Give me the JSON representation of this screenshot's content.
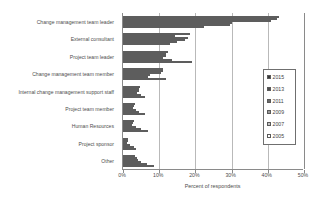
{
  "chart_data": {
    "type": "bar",
    "orientation": "horizontal",
    "title": "",
    "xlabel": "Percent of respondents",
    "ylabel": "",
    "xlim": [
      0,
      50
    ],
    "xticks": [
      "0%",
      "10%",
      "20%",
      "30%",
      "40%",
      "50%"
    ],
    "xtick_values": [
      0,
      10,
      20,
      30,
      40,
      50
    ],
    "grid": true,
    "legend_position": "right",
    "categories": [
      "Change management team leader",
      "External consultant",
      "Project team leader",
      "Change management team member",
      "Internal change management support staff",
      "Project team member",
      "Human Resources",
      "Project sponsor",
      "Other"
    ],
    "series": [
      {
        "name": "2015",
        "color": "#3a3a3a",
        "values": [
          43.0,
          18.5,
          12.5,
          11.0,
          4.8,
          3.2,
          3.0,
          1.5,
          3.2
        ]
      },
      {
        "name": "2013",
        "color": "#4f4f4f",
        "values": [
          42.5,
          14.5,
          12.0,
          11.0,
          4.5,
          3.0,
          2.8,
          1.4,
          3.8
        ]
      },
      {
        "name": "2011",
        "color": "#6b6b6b",
        "values": [
          41.0,
          18.0,
          12.0,
          10.5,
          4.5,
          2.8,
          2.5,
          1.2,
          4.2
        ]
      },
      {
        "name": "2009",
        "color": "#9a9a9a",
        "values": [
          30.0,
          17.0,
          11.0,
          7.5,
          4.0,
          3.5,
          3.5,
          2.0,
          5.0
        ]
      },
      {
        "name": "2007",
        "color": "#c4c4c4",
        "values": [
          29.5,
          15.0,
          13.5,
          7.0,
          5.0,
          4.5,
          5.0,
          3.0,
          6.5
        ]
      },
      {
        "name": "2005",
        "color": "#ffffff",
        "values": [
          22.5,
          13.0,
          19.0,
          12.0,
          6.0,
          6.0,
          7.0,
          3.5,
          8.5
        ]
      }
    ]
  },
  "legend": {
    "items": [
      {
        "label": "2015"
      },
      {
        "label": "2013"
      },
      {
        "label": "2011"
      },
      {
        "label": "2009"
      },
      {
        "label": "2007"
      },
      {
        "label": "2005"
      }
    ]
  },
  "axis": {
    "x_title": "Percent of respondents"
  }
}
